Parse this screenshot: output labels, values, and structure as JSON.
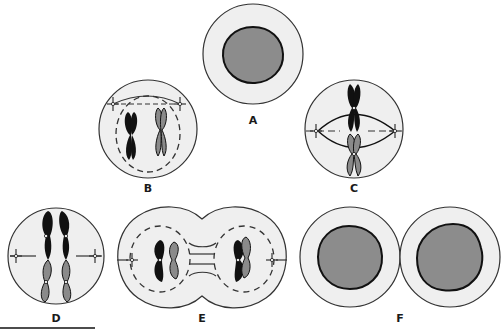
{
  "figure": {
    "colors": {
      "cytoplasm": "#efefef",
      "nucleus": "#8c8c8c",
      "outline": "#333333",
      "chromosome_dark": "#111111",
      "chromosome_light": "#8a8a8a",
      "background": "#ffffff"
    },
    "panels": [
      {
        "id": "A",
        "label": "A"
      },
      {
        "id": "B",
        "label": "B"
      },
      {
        "id": "C",
        "label": "C"
      },
      {
        "id": "D",
        "label": "D"
      },
      {
        "id": "E",
        "label": "E"
      },
      {
        "id": "F",
        "label": "F"
      }
    ]
  }
}
